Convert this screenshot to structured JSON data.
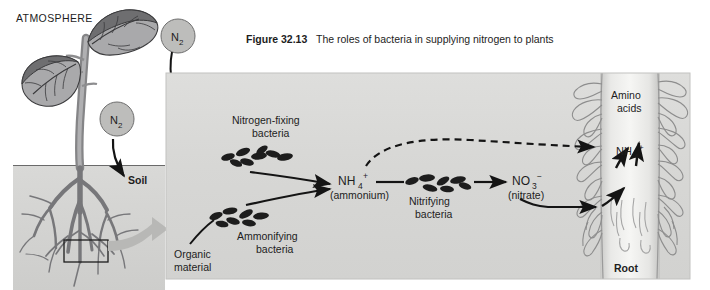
{
  "figure": {
    "number_label": "Figure 32.13",
    "caption": "The roles of bacteria in supplying nitrogen to plants"
  },
  "left_scene": {
    "atmosphere_label": "ATMOSPHERE",
    "soil_label": "Soil",
    "n2_upper_label": "N",
    "n2_upper_sub": "2",
    "n2_lower_label": "N",
    "n2_lower_sub": "2"
  },
  "main_panel": {
    "nitrogen_fixing_line1": "Nitrogen-fixing",
    "nitrogen_fixing_line2": "bacteria",
    "ammonifying_line1": "Ammonifying",
    "ammonifying_line2": "bacteria",
    "nitrifying_line1": "Nitrifying",
    "nitrifying_line2": "bacteria",
    "organic_line1": "Organic",
    "organic_line2": "material",
    "ammonium_formula": "NH",
    "ammonium_sub": "4",
    "ammonium_sup": "+",
    "ammonium_name": "(ammonium)",
    "nitrate_formula": "NO",
    "nitrate_sub": "3",
    "nitrate_sup": "−",
    "nitrate_name": "(nitrate)",
    "root_ammonium_formula": "NH",
    "root_ammonium_sub": "4",
    "root_ammonium_sup": "+",
    "amino_line1": "Amino",
    "amino_line2": "acids",
    "root_label": "Root"
  },
  "colors": {
    "panel_bg": "#d6d6d4",
    "panel_bg_light": "#e6e6e4",
    "soil_block": "#d4d4d2",
    "leaf_dark": "#6e6e70",
    "leaf_light": "#a9a9ab",
    "stem": "#9a9a9c",
    "root_dark": "#77777a",
    "circle_fill": "#b9b9b7",
    "callout_arrow": "#b3b3b1",
    "ink": "#1d1d1d",
    "root_column": "#ededeb",
    "root_hair_stroke": "#8d8d8d"
  }
}
